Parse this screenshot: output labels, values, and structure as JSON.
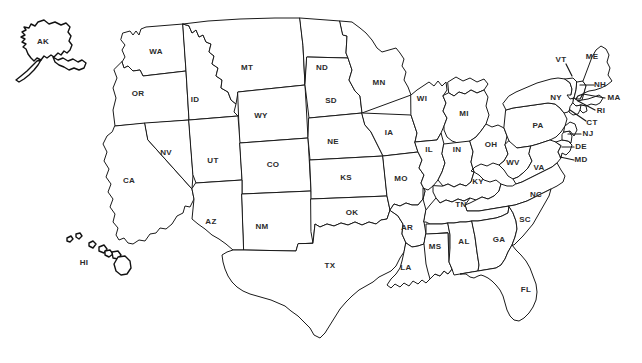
{
  "map": {
    "title": "United States Map with State Abbreviations",
    "background_color": "#ffffff",
    "outline_color": "#1a1a1a",
    "label_color": "#2b2b2b",
    "projection_note": "Contiguous US with Alaska inset upper-left and Hawaii inset lower-left",
    "states": [
      {
        "abbr": "AK",
        "name": "Alaska",
        "x": 43,
        "y": 42,
        "leader": null
      },
      {
        "abbr": "HI",
        "name": "Hawaii",
        "x": 84,
        "y": 263,
        "leader": null
      },
      {
        "abbr": "WA",
        "name": "Washington",
        "x": 156,
        "y": 52,
        "leader": null
      },
      {
        "abbr": "OR",
        "name": "Oregon",
        "x": 138,
        "y": 94,
        "leader": null
      },
      {
        "abbr": "CA",
        "name": "California",
        "x": 129,
        "y": 181,
        "leader": null
      },
      {
        "abbr": "NV",
        "name": "Nevada",
        "x": 166,
        "y": 153,
        "leader": null
      },
      {
        "abbr": "ID",
        "name": "Idaho",
        "x": 195,
        "y": 100,
        "leader": null
      },
      {
        "abbr": "MT",
        "name": "Montana",
        "x": 247,
        "y": 68,
        "leader": null
      },
      {
        "abbr": "WY",
        "name": "Wyoming",
        "x": 261,
        "y": 116,
        "leader": null
      },
      {
        "abbr": "UT",
        "name": "Utah",
        "x": 213,
        "y": 161,
        "leader": null
      },
      {
        "abbr": "CO",
        "name": "Colorado",
        "x": 273,
        "y": 165,
        "leader": null
      },
      {
        "abbr": "AZ",
        "name": "Arizona",
        "x": 211,
        "y": 222,
        "leader": null
      },
      {
        "abbr": "NM",
        "name": "New Mexico",
        "x": 262,
        "y": 227,
        "leader": null
      },
      {
        "abbr": "ND",
        "name": "North Dakota",
        "x": 322,
        "y": 68,
        "leader": null
      },
      {
        "abbr": "SD",
        "name": "South Dakota",
        "x": 331,
        "y": 101,
        "leader": null
      },
      {
        "abbr": "NE",
        "name": "Nebraska",
        "x": 333,
        "y": 142,
        "leader": null
      },
      {
        "abbr": "KS",
        "name": "Kansas",
        "x": 346,
        "y": 178,
        "leader": null
      },
      {
        "abbr": "OK",
        "name": "Oklahoma",
        "x": 352,
        "y": 213,
        "leader": null
      },
      {
        "abbr": "TX",
        "name": "Texas",
        "x": 330,
        "y": 266,
        "leader": null
      },
      {
        "abbr": "MN",
        "name": "Minnesota",
        "x": 379,
        "y": 83,
        "leader": null
      },
      {
        "abbr": "IA",
        "name": "Iowa",
        "x": 389,
        "y": 133,
        "leader": null
      },
      {
        "abbr": "MO",
        "name": "Missouri",
        "x": 401,
        "y": 179,
        "leader": null
      },
      {
        "abbr": "AR",
        "name": "Arkansas",
        "x": 407,
        "y": 228,
        "leader": null
      },
      {
        "abbr": "LA",
        "name": "Louisiana",
        "x": 406,
        "y": 268,
        "leader": null
      },
      {
        "abbr": "WI",
        "name": "Wisconsin",
        "x": 422,
        "y": 99,
        "leader": null
      },
      {
        "abbr": "IL",
        "name": "Illinois",
        "x": 429,
        "y": 150,
        "leader": null
      },
      {
        "abbr": "MS",
        "name": "Mississippi",
        "x": 435,
        "y": 247,
        "leader": null
      },
      {
        "abbr": "IN",
        "name": "Indiana",
        "x": 457,
        "y": 150,
        "leader": null
      },
      {
        "abbr": "MI",
        "name": "Michigan",
        "x": 464,
        "y": 114,
        "leader": null
      },
      {
        "abbr": "KY",
        "name": "Kentucky",
        "x": 478,
        "y": 182,
        "leader": null
      },
      {
        "abbr": "TN",
        "name": "Tennessee",
        "x": 461,
        "y": 205,
        "leader": null
      },
      {
        "abbr": "AL",
        "name": "Alabama",
        "x": 464,
        "y": 242,
        "leader": null
      },
      {
        "abbr": "OH",
        "name": "Ohio",
        "x": 491,
        "y": 145,
        "leader": null
      },
      {
        "abbr": "GA",
        "name": "Georgia",
        "x": 499,
        "y": 240,
        "leader": null
      },
      {
        "abbr": "WV",
        "name": "West Virginia",
        "x": 513,
        "y": 163,
        "leader": null
      },
      {
        "abbr": "SC",
        "name": "South Carolina",
        "x": 525,
        "y": 220,
        "leader": null
      },
      {
        "abbr": "FL",
        "name": "Florida",
        "x": 526,
        "y": 290,
        "leader": null
      },
      {
        "abbr": "NC",
        "name": "North Carolina",
        "x": 536,
        "y": 195,
        "leader": null
      },
      {
        "abbr": "VA",
        "name": "Virginia",
        "x": 539,
        "y": 168,
        "leader": null
      },
      {
        "abbr": "PA",
        "name": "Pennsylvania",
        "x": 538,
        "y": 126,
        "leader": null
      },
      {
        "abbr": "NY",
        "name": "New York",
        "x": 556,
        "y": 98,
        "leader": null
      },
      {
        "abbr": "VT",
        "name": "Vermont",
        "x": 561,
        "y": 60,
        "leader": "566,64 572,76"
      },
      {
        "abbr": "ME",
        "name": "Maine",
        "x": 592,
        "y": 57,
        "leader": null
      },
      {
        "abbr": "NH",
        "name": "New Hampshire",
        "x": 600,
        "y": 85,
        "leader": "594,85 580,85"
      },
      {
        "abbr": "MA",
        "name": "Massachusetts",
        "x": 614,
        "y": 98,
        "leader": "605,98 583,94"
      },
      {
        "abbr": "RI",
        "name": "Rhode Island",
        "x": 601,
        "y": 111,
        "leader": "595,110 578,101"
      },
      {
        "abbr": "CT",
        "name": "Connecticut",
        "x": 592,
        "y": 123,
        "leader": "586,121 570,110"
      },
      {
        "abbr": "NJ",
        "name": "New Jersey",
        "x": 588,
        "y": 134,
        "leader": "581,134 568,134"
      },
      {
        "abbr": "DE",
        "name": "Delaware",
        "x": 581,
        "y": 147,
        "leader": "574,147 562,147"
      },
      {
        "abbr": "MD",
        "name": "Maryland",
        "x": 581,
        "y": 160,
        "leader": "574,160 560,157"
      }
    ]
  }
}
